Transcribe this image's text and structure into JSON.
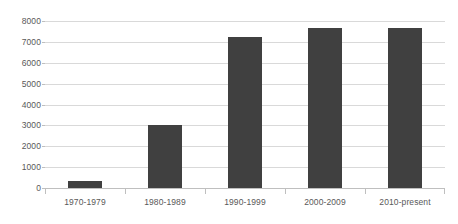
{
  "chart_data": {
    "type": "bar",
    "title": "",
    "subtitle": "",
    "xlabel": "",
    "ylabel": "",
    "categories": [
      "1970-1979",
      "1980-1989",
      "1990-1999",
      "2000-2009",
      "2010-present"
    ],
    "values": [
      330,
      3000,
      7250,
      7680,
      7680
    ],
    "series": [
      {
        "name": "",
        "values": [
          330,
          3000,
          7250,
          7680,
          7680
        ]
      }
    ],
    "ylim": [
      0,
      8000
    ],
    "ytick_labels": [
      "0",
      "1000",
      "2000",
      "3000",
      "4000",
      "5000",
      "6000",
      "7000",
      "8000"
    ],
    "ytick_values": [
      0,
      1000,
      2000,
      3000,
      4000,
      5000,
      6000,
      7000,
      8000
    ],
    "grid": true,
    "grid_axis": "y",
    "legend": false,
    "legend_position": "none",
    "annotations": [],
    "colors": {
      "bar": "#404040",
      "gridline": "#d9d9d9",
      "axis_line": "#bfbfbf",
      "tick_label": "#595959",
      "background": "#ffffff"
    }
  }
}
